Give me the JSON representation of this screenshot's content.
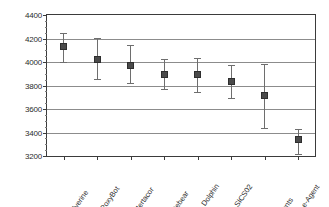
{
  "chart_data": {
    "type": "scatter",
    "title": "",
    "xlabel": "",
    "ylabel": "",
    "ylim": [
      3200,
      4400
    ],
    "ytick_step": 200,
    "yticks": [
      3200,
      3400,
      3600,
      3800,
      4000,
      4200,
      4400
    ],
    "ytick_labels": [
      "3200",
      "3400",
      "3600",
      "3800",
      "4000",
      "4200",
      "4400"
    ],
    "grid": "horizontal",
    "legend": "none",
    "categories": [
      "Wolverine",
      "RoxyBot",
      "Mertacor",
      "Whitebear",
      "Dolphin",
      "SICS02",
      "LearnAgents",
      "e-Agent"
    ],
    "values": [
      4130,
      4025,
      3968,
      3897,
      3893,
      3836,
      3714,
      3340
    ],
    "error_low": [
      4000,
      3858,
      3820,
      3766,
      3742,
      3695,
      3437,
      3218
    ],
    "error_high": [
      4248,
      4208,
      4148,
      4022,
      4030,
      3975,
      3985,
      3428
    ],
    "marker": "square",
    "marker_color": "#4a4a4a",
    "errorbar_color": "#6e6e6e",
    "gridline_color": "#8c8c8c",
    "frame_color": "#3b3b3b",
    "background_color": "#ffffff"
  }
}
